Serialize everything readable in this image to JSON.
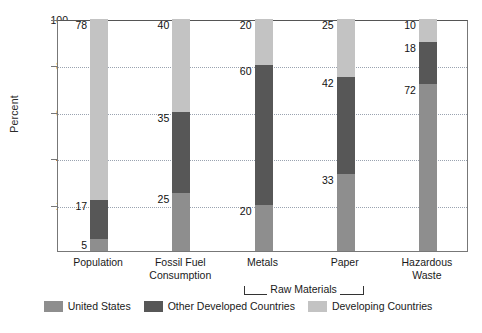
{
  "chart_data": {
    "type": "bar",
    "subtype": "stacked-bar-100",
    "title": "",
    "xlabel": "",
    "ylabel": "Percent",
    "ylim": [
      0,
      100
    ],
    "yticks": [
      20,
      40,
      60,
      80,
      100
    ],
    "grid": true,
    "legend_position": "bottom",
    "categories": [
      "Population",
      "Fossil Fuel Consumption",
      "Metals",
      "Paper",
      "Hazardous Waste"
    ],
    "category_lines": [
      [
        "Population",
        ""
      ],
      [
        "Fossil Fuel",
        "Consumption"
      ],
      [
        "Metals",
        ""
      ],
      [
        "Paper",
        ""
      ],
      [
        "Hazardous",
        "Waste"
      ]
    ],
    "series": [
      {
        "name": "United States",
        "color": "#8e8e8e",
        "values": [
          5,
          25,
          20,
          33,
          72
        ]
      },
      {
        "name": "Other Developed Countries",
        "color": "#575757",
        "values": [
          17,
          35,
          60,
          42,
          18
        ]
      },
      {
        "name": "Developing Countries",
        "color": "#c3c3c3",
        "values": [
          78,
          40,
          20,
          25,
          10
        ]
      }
    ],
    "annotations": [
      {
        "text": "Raw Materials",
        "spans": [
          "Metals",
          "Paper"
        ],
        "style": "bracket-below-axis"
      }
    ]
  },
  "axis": {
    "y_title": "Percent",
    "y_tick_labels": [
      "100",
      "80",
      "60",
      "40",
      "20"
    ]
  },
  "legend": {
    "items": [
      {
        "label": "United States",
        "color": "#8e8e8e",
        "swatch_name": "legend-swatch-united-states"
      },
      {
        "label": "Other Developed Countries",
        "color": "#575757",
        "swatch_name": "legend-swatch-other-developed"
      },
      {
        "label": "Developing Countries",
        "color": "#c3c3c3",
        "swatch_name": "legend-swatch-developing"
      }
    ]
  },
  "bracket": {
    "label": "Raw Materials"
  }
}
